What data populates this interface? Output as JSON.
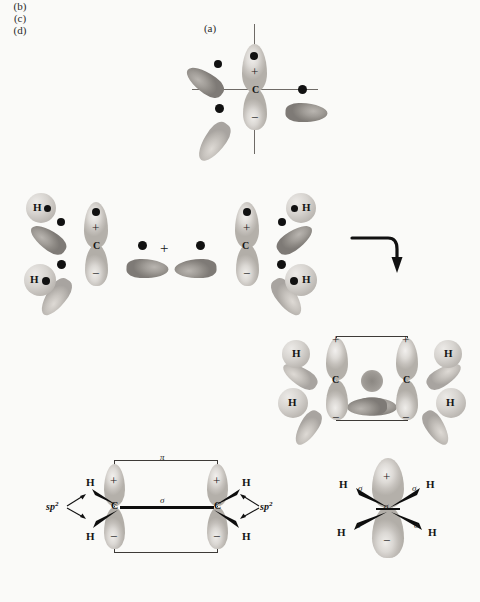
{
  "figure": {
    "background_color": "#fafaf8",
    "ink_color": "#1a1a1a"
  },
  "panels": [
    {
      "id": "a",
      "label": "(a)",
      "description": "Single sp2-hybridized carbon atom with perpendicular p orbital"
    },
    {
      "id": "b",
      "label": "(b)",
      "description": "Two CH2 fragments combining to form ethylene"
    },
    {
      "id": "c",
      "label": "(c)",
      "description": "Ethylene side view showing sigma and pi bonds"
    },
    {
      "id": "d",
      "label": "(d)",
      "description": "Ethylene end-on view showing sigma bonds"
    }
  ],
  "panel_a": {
    "label": "(a)",
    "center_atom": "C",
    "plus_sign": "+",
    "minus_sign": "−",
    "electron_count": 4
  },
  "panel_b": {
    "label": "(b)",
    "join_symbol": "+",
    "left_fragment": {
      "center_atom": "C",
      "plus_sign": "+",
      "minus_sign": "−",
      "hydrogens": [
        "H",
        "H"
      ]
    },
    "right_fragment": {
      "center_atom": "C",
      "plus_sign": "+",
      "minus_sign": "−",
      "hydrogens": [
        "H",
        "H"
      ]
    },
    "product": {
      "left_carbon": "C",
      "right_carbon": "C",
      "plus_left": "+",
      "plus_right": "+",
      "minus_left": "−",
      "minus_right": "−",
      "hydrogens": [
        "H",
        "H",
        "H",
        "H"
      ]
    },
    "arrow_name": "bent-reaction-arrow"
  },
  "panel_c": {
    "label": "(c)",
    "left_carbon": "C",
    "right_carbon": "C",
    "pi_label": "π",
    "sigma_label": "σ",
    "plus_left": "+",
    "plus_right": "+",
    "minus_left": "−",
    "minus_right": "−",
    "hybrid_label_left": "sp",
    "hybrid_superscript_left": "2",
    "hybrid_label_right": "sp",
    "hybrid_superscript_right": "2",
    "hydrogens": [
      "H",
      "H",
      "H",
      "H"
    ]
  },
  "panel_d": {
    "label": "(d)",
    "plus_sign": "+",
    "minus_sign": "−",
    "sigma_labels": [
      "σ",
      "σ",
      "σ",
      "σ"
    ],
    "center_sigma_label": "σ",
    "hydrogens": [
      "H",
      "H",
      "H",
      "H"
    ]
  }
}
